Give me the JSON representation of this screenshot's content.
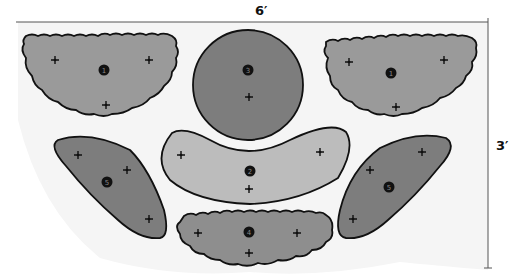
{
  "diagram": {
    "dimensions": {
      "width_label": "6′",
      "height_label": "3′"
    },
    "colors": {
      "background_area": "#f3f3f3",
      "type_1": "#9a9a9a",
      "type_2": "#bcbcbc",
      "type_3": "#7d7d7d",
      "type_4": "#8e8e8e",
      "type_5": "#7d7d7d",
      "outline": "#111111",
      "dimension_line": "#555555"
    },
    "pieces": [
      {
        "id": "piece-1-left",
        "number": "1",
        "shape": "half-round scalloped",
        "plants": 3
      },
      {
        "id": "piece-3-center",
        "number": "3",
        "shape": "circle",
        "plants": 1
      },
      {
        "id": "piece-1-right",
        "number": "1",
        "shape": "half-round scalloped",
        "plants": 3
      },
      {
        "id": "piece-5-left",
        "number": "5",
        "shape": "teardrop",
        "plants": 3
      },
      {
        "id": "piece-2-center",
        "number": "2",
        "shape": "crescent",
        "plants": 3
      },
      {
        "id": "piece-5-right",
        "number": "5",
        "shape": "teardrop",
        "plants": 3
      },
      {
        "id": "piece-4-bottom",
        "number": "4",
        "shape": "scalloped oval",
        "plants": 3
      }
    ]
  }
}
